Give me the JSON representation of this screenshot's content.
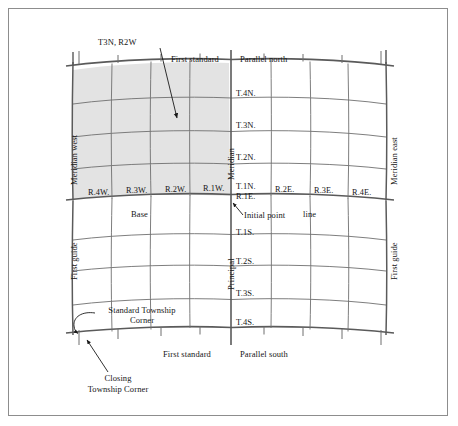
{
  "figure": {
    "type": "plss-survey-diagram",
    "colors": {
      "shading": "#e3e3e3",
      "line": "#6f6f6f",
      "heavy_line": "#5a5a5a",
      "text": "#161616",
      "frame": "#8d8d8d",
      "background": "#ffffff"
    }
  },
  "callouts": {
    "township_range": "T3N, R2W",
    "initial_point": "Initial point",
    "standard_township_corner_line1": "Standard Township",
    "standard_township_corner_line2": "Corner",
    "closing_township_corner_line1": "Closing",
    "closing_township_corner_line2": "Township Corner"
  },
  "lines": {
    "first_standard_north": "First standard",
    "parallel_north": "Parallel north",
    "first_standard_south": "First standard",
    "parallel_south": "Parallel south",
    "base": "Base",
    "base_line": "line",
    "meridian_west": "Meridian west",
    "meridian_east": "Meridian east",
    "first_guide_west": "First guide",
    "first_guide_east": "First guide",
    "principal": "Principal",
    "meridian": "Meridian"
  },
  "ranges": {
    "west": [
      "R.4W.",
      "R.3W.",
      "R.2W.",
      "R.1W."
    ],
    "east": [
      "R.1E.",
      "R.2E.",
      "R.3E.",
      "R.4E."
    ]
  },
  "townships": {
    "north": [
      "T.4N.",
      "T.3N.",
      "T.2N.",
      "T.1N."
    ],
    "south": [
      "T.1S.",
      "T.2S.",
      "T.3S.",
      "T.4S."
    ]
  }
}
